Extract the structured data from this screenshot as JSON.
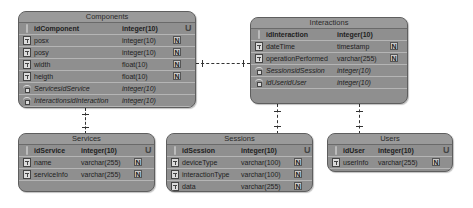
{
  "tables": {
    "components": {
      "title": "Components",
      "columns": [
        {
          "name": "idComponent",
          "type": "integer(10)",
          "kind": "pk",
          "flag": "U"
        },
        {
          "name": "posx",
          "type": "integer(10)",
          "kind": "col",
          "flag": "N"
        },
        {
          "name": "posy",
          "type": "integer(10)",
          "kind": "col",
          "flag": "N"
        },
        {
          "name": "width",
          "type": "float(10)",
          "kind": "col",
          "flag": "N"
        },
        {
          "name": "heigth",
          "type": "float(10)",
          "kind": "col",
          "flag": "N"
        },
        {
          "name": "ServicesidService",
          "type": "integer(10)",
          "kind": "fk",
          "flag": ""
        },
        {
          "name": "InteractionsidInteraction",
          "type": "integer(10)",
          "kind": "fk",
          "flag": ""
        }
      ]
    },
    "interactions": {
      "title": "Interactions",
      "columns": [
        {
          "name": "idInteraction",
          "type": "integer(10)",
          "kind": "pk",
          "flag": "U"
        },
        {
          "name": "dateTime",
          "type": "timestamp",
          "kind": "col",
          "flag": "N"
        },
        {
          "name": "operationPerformed",
          "type": "varchar(255)",
          "kind": "col",
          "flag": "N"
        },
        {
          "name": "SessionsidSession",
          "type": "integer(10)",
          "kind": "fk",
          "flag": ""
        },
        {
          "name": "idUseridUser",
          "type": "integer(10)",
          "kind": "fk",
          "flag": ""
        }
      ]
    },
    "services": {
      "title": "Services",
      "columns": [
        {
          "name": "idService",
          "type": "integer(10)",
          "kind": "pk",
          "flag": "U"
        },
        {
          "name": "name",
          "type": "varchar(255)",
          "kind": "col",
          "flag": "N"
        },
        {
          "name": "serviceInfo",
          "type": "varchar(255)",
          "kind": "col",
          "flag": "N"
        }
      ]
    },
    "sessions": {
      "title": "Sessions",
      "columns": [
        {
          "name": "idSession",
          "type": "integer(10)",
          "kind": "pk",
          "flag": "U"
        },
        {
          "name": "deviceType",
          "type": "varchar(100)",
          "kind": "col",
          "flag": "N"
        },
        {
          "name": "interactionType",
          "type": "varchar(100)",
          "kind": "col",
          "flag": "N"
        },
        {
          "name": "data",
          "type": "varchar(255)",
          "kind": "col",
          "flag": "N"
        }
      ]
    },
    "users": {
      "title": "Users",
      "columns": [
        {
          "name": "idUser",
          "type": "integer(10)",
          "kind": "pk",
          "flag": "U"
        },
        {
          "name": "userInfo",
          "type": "varchar(255)",
          "kind": "col",
          "flag": "N"
        }
      ]
    }
  },
  "relationships": [
    {
      "from": "Components",
      "to": "Interactions",
      "style": "dashed",
      "cardinality": "one-to-one"
    },
    {
      "from": "Components",
      "to": "Services",
      "style": "dashed",
      "cardinality": "one-to-one"
    },
    {
      "from": "Interactions",
      "to": "Sessions",
      "style": "dashed",
      "cardinality": "one-to-one"
    },
    {
      "from": "Interactions",
      "to": "Users",
      "style": "dashed",
      "cardinality": "one-to-one"
    }
  ],
  "colors": {
    "table_fill": "#8f8f8f",
    "table_border": "#5e5e5e",
    "row_divider": "#b5b5b5",
    "text": "#1e1e1e",
    "connector": "#333333"
  }
}
